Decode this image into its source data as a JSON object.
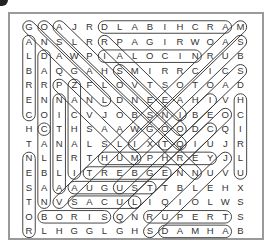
{
  "puzzle": {
    "type": "word-search",
    "rows": [
      "GOAJRDLABIHCRAM",
      "ANSLRRPAGIRWOAS",
      "LDAWPIALOCINRUB",
      "BAQGAHSMIRRCICS",
      "RRPZFLOVTSOTOAD",
      "ENNANLDNEEAHIVH",
      "COICVJOBSNIBEOC",
      "HCTHSAAWGOODCQI",
      "TANALSLIXTQIUJR",
      "NLERTHUMPHREYJL",
      "EBLITREBGENNUVU",
      "SAAAUGUSTTBLEHX",
      "TNVSACULIQIOLWS",
      "OBORISQNRUPERTS",
      "RLHGGLGHSDAMHAB"
    ],
    "found_words": [
      {
        "r1": 0,
        "c1": 5,
        "r2": 0,
        "c2": 13
      },
      {
        "r1": 2,
        "c1": 5,
        "r2": 2,
        "c2": 11
      },
      {
        "r1": 9,
        "c1": 5,
        "r2": 9,
        "c2": 12
      },
      {
        "r1": 10,
        "c1": 4,
        "r2": 10,
        "c2": 9
      },
      {
        "r1": 11,
        "c1": 3,
        "r2": 11,
        "c2": 8
      },
      {
        "r1": 12,
        "c1": 3,
        "r2": 12,
        "c2": 7
      },
      {
        "r1": 13,
        "c1": 1,
        "r2": 13,
        "c2": 5
      },
      {
        "r1": 13,
        "c1": 8,
        "r2": 13,
        "c2": 13
      },
      {
        "r1": 14,
        "c1": 9,
        "r2": 14,
        "c2": 13
      },
      {
        "r1": 1,
        "c1": 0,
        "r2": 6,
        "c2": 0
      },
      {
        "r1": 9,
        "c1": 0,
        "r2": 14,
        "c2": 0
      },
      {
        "r1": 2,
        "c1": 1,
        "r2": 7,
        "c2": 1
      },
      {
        "r1": 7,
        "c1": 1,
        "r2": 12,
        "c2": 1
      },
      {
        "r1": 5,
        "c1": 2,
        "r2": 11,
        "c2": 2
      },
      {
        "r1": 4,
        "c1": 3,
        "r2": 10,
        "c2": 3
      },
      {
        "r1": 5,
        "c1": 14,
        "r2": 10,
        "c2": 14
      },
      {
        "r1": 0,
        "c1": 0,
        "r2": 5,
        "c2": 5
      },
      {
        "r1": 0,
        "c1": 1,
        "r2": 10,
        "c2": 11
      },
      {
        "r1": 0,
        "c1": 2,
        "r2": 8,
        "c2": 10
      },
      {
        "r1": 1,
        "c1": 5,
        "r2": 6,
        "c2": 10
      },
      {
        "r1": 3,
        "c1": 6,
        "r2": 7,
        "c2": 10
      },
      {
        "r1": 4,
        "c1": 2,
        "r2": 9,
        "c2": 7
      },
      {
        "r1": 3,
        "c1": 14,
        "r2": 8,
        "c2": 9
      },
      {
        "r1": 1,
        "c1": 14,
        "r2": 8,
        "c2": 7
      },
      {
        "r1": 0,
        "c1": 14,
        "r2": 12,
        "c2": 2
      },
      {
        "r1": 5,
        "c1": 12,
        "r2": 11,
        "c2": 6
      },
      {
        "r1": 9,
        "c1": 13,
        "r2": 14,
        "c2": 8
      },
      {
        "r1": 6,
        "c1": 13,
        "r2": 13,
        "c2": 6
      },
      {
        "r1": 7,
        "c1": 12,
        "r2": 12,
        "c2": 7
      }
    ]
  }
}
